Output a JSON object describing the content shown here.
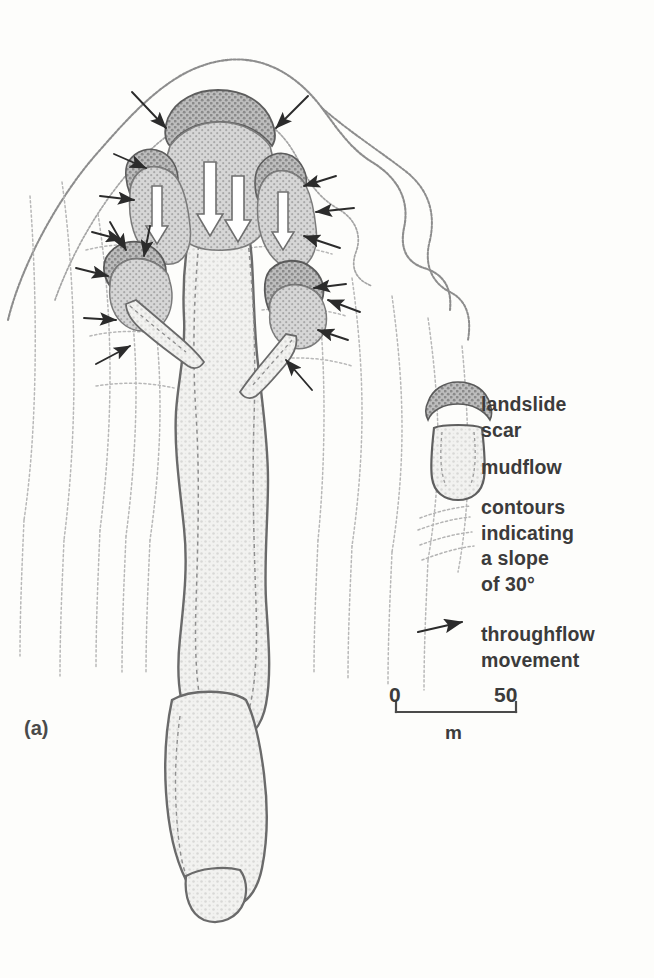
{
  "figure": {
    "label": "(a)",
    "caption_note": "",
    "background_color": "#fdfdfb"
  },
  "colors": {
    "scar_fill": "#9c9c9c",
    "scar_crown": "#6e6e6e",
    "mudflow_fill": "#dedede",
    "mudflow_outline": "#6a6a6a",
    "contour_line": "#b5b5b5",
    "outer_boundary": "#8d8d8d",
    "arrow": "#2b2b2b",
    "text": "#3b3b3b"
  },
  "legend": {
    "items": [
      {
        "key": "landslide-scar",
        "icon": "landslide-scar-icon",
        "label": "landslide\nscar"
      },
      {
        "key": "mudflow",
        "icon": "mudflow-icon",
        "label": "mudflow"
      },
      {
        "key": "contours",
        "icon": "contour-lines-icon",
        "label": "contours\nindicating\na slope\nof 30°"
      },
      {
        "key": "throughflow",
        "icon": "arrow-icon",
        "label": "throughflow\nmovement"
      }
    ]
  },
  "scale_bar": {
    "min_label": "0",
    "max_label": "50",
    "unit": "m",
    "length_px": 120,
    "represents": 50
  },
  "map_features": {
    "landslide_scars": 4,
    "mudflow_tongues": 4,
    "throughflow_arrows": 17,
    "contour_set": "dotted slope contours indicating a 30 degree slope"
  }
}
